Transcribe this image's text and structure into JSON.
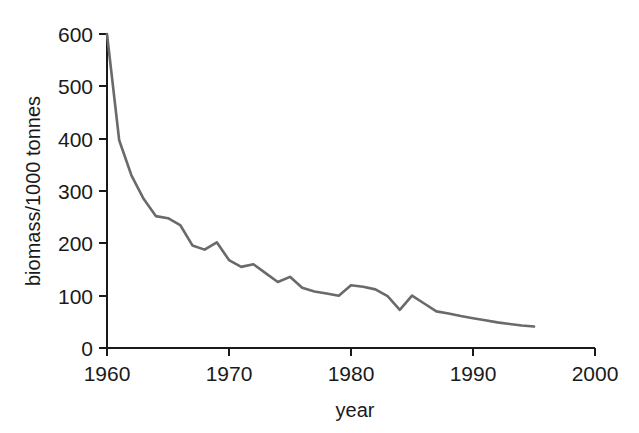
{
  "chart_data": {
    "type": "line",
    "title": "",
    "xlabel": "year",
    "ylabel": "biomass/1000 tonnes",
    "xlim": [
      1960,
      2000
    ],
    "ylim": [
      0,
      600
    ],
    "grid": false,
    "legend": null,
    "line_color": "#6a6a6a",
    "axis_color": "#1a1a1a",
    "xticks": [
      1960,
      1970,
      1980,
      1990,
      2000
    ],
    "xtick_labels": [
      "1960",
      "1970",
      "1980",
      "1990",
      "2000"
    ],
    "yticks": [
      0,
      100,
      200,
      300,
      400,
      500,
      600
    ],
    "ytick_labels": [
      "0",
      "100",
      "200",
      "300",
      "400",
      "500",
      "600"
    ],
    "series": [
      {
        "name": "biomass",
        "x": [
          1960,
          1961,
          1962,
          1963,
          1964,
          1965,
          1966,
          1967,
          1968,
          1969,
          1970,
          1971,
          1972,
          1973,
          1974,
          1975,
          1976,
          1977,
          1978,
          1979,
          1980,
          1981,
          1982,
          1983,
          1984,
          1985,
          1986,
          1987,
          1988,
          1989,
          1990,
          1991,
          1992,
          1993,
          1994,
          1995
        ],
        "values": [
          600,
          397,
          330,
          285,
          252,
          248,
          235,
          196,
          188,
          202,
          168,
          155,
          160,
          143,
          126,
          136,
          115,
          108,
          104,
          100,
          120,
          117,
          112,
          99,
          73,
          100,
          85,
          70,
          66,
          61,
          57,
          53,
          49,
          46,
          43,
          41
        ]
      }
    ]
  }
}
